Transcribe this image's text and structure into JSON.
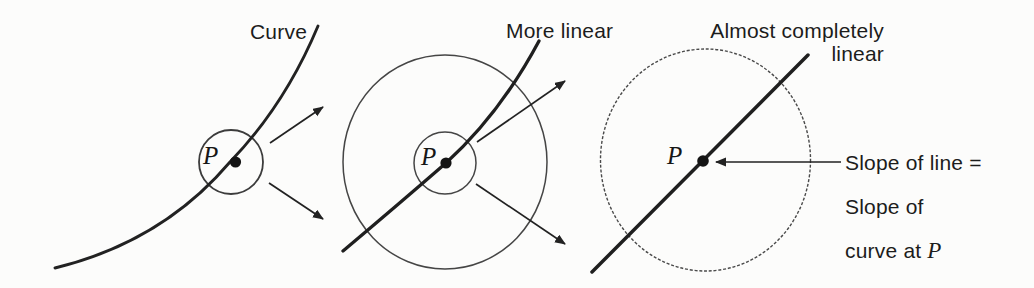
{
  "colors": {
    "background": "#fcfcfb",
    "ink": "#1f1f1f",
    "circle_stroke": "#454545"
  },
  "panels": [
    {
      "id": "curve",
      "label": "Curve",
      "point_label": "P"
    },
    {
      "id": "more-linear",
      "label": "More linear",
      "point_label": "P"
    },
    {
      "id": "almost-linear",
      "label": "Almost completely\nlinear",
      "point_label": "P"
    }
  ],
  "annotation": {
    "line1": "Slope of line =",
    "line2": "Slope of",
    "line3_text": "curve at ",
    "line3_symbol": "P"
  }
}
